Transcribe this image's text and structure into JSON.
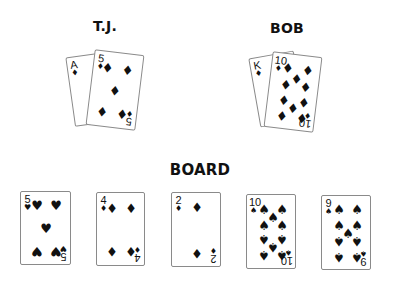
{
  "players": [
    {
      "name": "T.J.",
      "cards": [
        {
          "rank": "A",
          "suit": "♦",
          "suit_name": "diamonds"
        },
        {
          "rank": "5",
          "suit": "♦",
          "suit_name": "diamonds"
        }
      ]
    },
    {
      "name": "BOB",
      "cards": [
        {
          "rank": "K",
          "suit": "♦",
          "suit_name": "diamonds"
        },
        {
          "rank": "10",
          "suit": "♦",
          "suit_name": "diamonds"
        }
      ]
    }
  ],
  "board": {
    "label": "BOARD",
    "cards": [
      {
        "rank": "5",
        "suit": "♥",
        "suit_name": "hearts"
      },
      {
        "rank": "4",
        "suit": "♦",
        "suit_name": "diamonds"
      },
      {
        "rank": "2",
        "suit": "♦",
        "suit_name": "diamonds"
      },
      {
        "rank": "10",
        "suit": "♠",
        "suit_name": "spades"
      },
      {
        "rank": "9",
        "suit": "♠",
        "suit_name": "spades"
      }
    ]
  }
}
